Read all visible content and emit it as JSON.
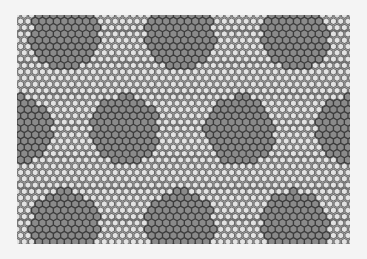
{
  "image": {
    "description": "Grayscale hexagonal (honeycomb) lattice with moiré superlattice of darker hexagonal patches",
    "background": "#f4f4f4",
    "lattice_area": {
      "x": 17,
      "y": 15,
      "width": 333,
      "height": 229
    },
    "lattice_color": "#6a6a6a",
    "cell_fill": "#e2e2e2",
    "patch_fill": "#8a8a8a",
    "patch_stroke": "#3c3c3c",
    "hex_size": 4.2,
    "patch_radius": 34,
    "patches": [
      {
        "cx": 65,
        "cy": 35
      },
      {
        "cx": 180,
        "cy": 35
      },
      {
        "cx": 295,
        "cy": 35
      },
      {
        "cx": 17,
        "cy": 130
      },
      {
        "cx": 125,
        "cy": 130
      },
      {
        "cx": 240,
        "cy": 130
      },
      {
        "cx": 350,
        "cy": 130
      },
      {
        "cx": 65,
        "cy": 225
      },
      {
        "cx": 180,
        "cy": 225
      },
      {
        "cx": 295,
        "cy": 225
      }
    ]
  }
}
